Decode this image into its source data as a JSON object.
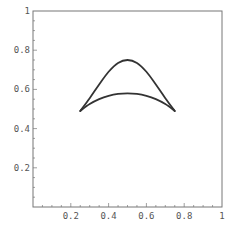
{
  "chart_data": {
    "type": "line",
    "title": "",
    "xlabel": "",
    "ylabel": "",
    "xlim": [
      0,
      1
    ],
    "ylim": [
      0,
      1
    ],
    "grid": false,
    "legend": null,
    "frame": true,
    "x_ticks": [
      {
        "value": 0.2,
        "label": "0.2"
      },
      {
        "value": 0.4,
        "label": "0.4"
      },
      {
        "value": 0.6,
        "label": "0.6"
      },
      {
        "value": 0.8,
        "label": "0.8"
      },
      {
        "value": 1.0,
        "label": "1"
      }
    ],
    "y_ticks": [
      {
        "value": 0.2,
        "label": "0.2"
      },
      {
        "value": 0.4,
        "label": "0.4"
      },
      {
        "value": 0.6,
        "label": "0.6"
      },
      {
        "value": 0.8,
        "label": "0.8"
      },
      {
        "value": 1.0,
        "label": "1"
      }
    ],
    "series": [
      {
        "name": "upper curve",
        "color": "#333333",
        "x": [
          0.25,
          0.3,
          0.35,
          0.4,
          0.45,
          0.5,
          0.55,
          0.6,
          0.65,
          0.7,
          0.75
        ],
        "y": [
          0.49,
          0.555,
          0.625,
          0.69,
          0.735,
          0.75,
          0.735,
          0.69,
          0.625,
          0.555,
          0.49
        ]
      },
      {
        "name": "lower curve",
        "color": "#333333",
        "x": [
          0.25,
          0.3,
          0.35,
          0.4,
          0.45,
          0.5,
          0.55,
          0.6,
          0.65,
          0.7,
          0.75
        ],
        "y": [
          0.49,
          0.525,
          0.55,
          0.567,
          0.577,
          0.58,
          0.577,
          0.567,
          0.55,
          0.525,
          0.49
        ]
      }
    ]
  },
  "layout": {
    "plot_left": 33,
    "plot_top": 11,
    "plot_width": 189,
    "plot_height": 196,
    "axis_color": "#777777",
    "line_width": 1.8
  }
}
